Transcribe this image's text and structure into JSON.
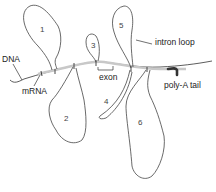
{
  "diagram": {
    "labels": {
      "dna": "DNA",
      "mrna": "mRNA",
      "exon": "exon",
      "intron_loop": "intron loop",
      "poly_a_tail": "poly-A tail"
    },
    "loops": [
      {
        "id": "1",
        "label": "1",
        "side": "above"
      },
      {
        "id": "2",
        "label": "2",
        "side": "below"
      },
      {
        "id": "3",
        "label": "3",
        "side": "above"
      },
      {
        "id": "4",
        "label": "4",
        "side": "below"
      },
      {
        "id": "5",
        "label": "5",
        "side": "above"
      },
      {
        "id": "6",
        "label": "6",
        "side": "below"
      }
    ],
    "colors": {
      "line": "#333333",
      "mrna": "#c8c8c8",
      "background": "#ffffff"
    }
  }
}
